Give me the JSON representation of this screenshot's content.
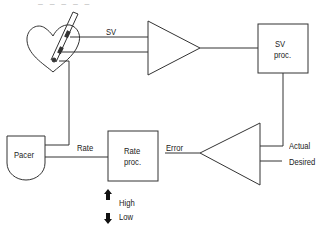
{
  "diagram": {
    "type": "block-diagram",
    "header_fragment": "— — — — —",
    "labels": {
      "sv_line": "SV",
      "sv_proc_line1": "SV",
      "sv_proc_line2": "proc.",
      "pacer": "Pacer",
      "rate_line": "Rate",
      "rate_proc_line1": "Rate",
      "rate_proc_line2": "proc.",
      "error": "Error",
      "actual": "Actual",
      "desired": "Desired",
      "high": "High",
      "low": "Low"
    },
    "nodes": [
      "heart-with-catheter",
      "sv-amplifier",
      "sv-proc",
      "comparator",
      "rate-proc",
      "pacer"
    ],
    "stroke_color": "#333333"
  }
}
